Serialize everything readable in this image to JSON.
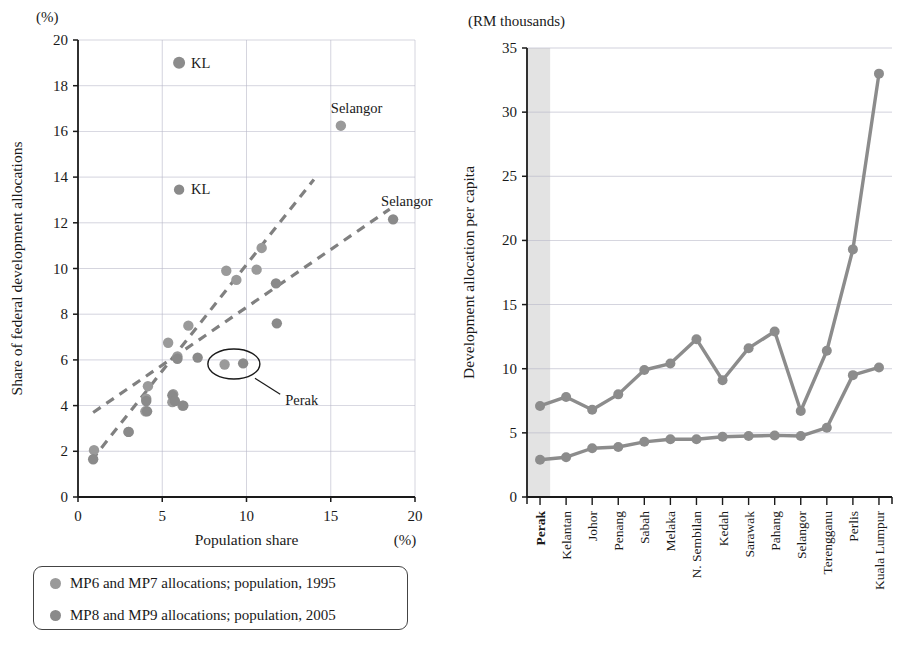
{
  "figure": {
    "panels": [
      "scatter-population-vs-allocation",
      "line-allocation-per-capita"
    ]
  },
  "left": {
    "unit_note": "(%)",
    "y_axis_title": "Share of federal development allocations",
    "x_axis_title": "Population share",
    "x_unit_note": "(%)",
    "y_ticks": [
      "0",
      "2",
      "4",
      "6",
      "8",
      "10",
      "12",
      "14",
      "16",
      "18",
      "20"
    ],
    "x_ticks": [
      "0",
      "5",
      "10",
      "15",
      "20"
    ],
    "annotations": [
      {
        "text": "KL",
        "x": 6.0,
        "y": 19.0
      },
      {
        "text": "Selangor",
        "x": 15.6,
        "y": 16.25
      },
      {
        "text": "KL",
        "x": 6.0,
        "y": 13.45
      },
      {
        "text": "Selangor",
        "x": 18.7,
        "y": 12.15
      },
      {
        "text": "Perak",
        "x": 9.8,
        "y": 5.85
      }
    ],
    "callout_label": "Perak",
    "colors": {
      "marker": "#8c8c8c",
      "trend": "#808080",
      "axis": "#1a1a1a",
      "grid": "#b9b9c9"
    }
  },
  "right": {
    "unit_note": "(RM thousands)",
    "y_axis_title": "Development allocation per capita",
    "y_ticks": [
      "0",
      "5",
      "10",
      "15",
      "20",
      "25",
      "30",
      "35"
    ],
    "highlight_category": "Perak",
    "colors": {
      "line": "#8c8c8c",
      "marker": "#8c8c8c",
      "band": "#e3e3e3",
      "grid": "#b9b9c9"
    }
  },
  "legend": {
    "items": [
      {
        "label": "MP6 and MP7 allocations; population, 1995",
        "color": "#9a9a9a"
      },
      {
        "label": "MP8 and MP9 allocations; population, 2005",
        "color": "#8a8a8a"
      }
    ]
  },
  "chart_data": [
    {
      "type": "scatter",
      "id": "scatter-population-vs-allocation",
      "title": "",
      "xlabel": "Population share",
      "ylabel": "Share of federal development allocations",
      "xunit": "(%)",
      "yunit": "(%)",
      "xlim": [
        0,
        20
      ],
      "ylim": [
        0,
        20
      ],
      "xticks": [
        0,
        5,
        10,
        15,
        20
      ],
      "yticks": [
        0,
        2,
        4,
        6,
        8,
        10,
        12,
        14,
        16,
        18,
        20
      ],
      "grid": true,
      "legend_position": "below-plot",
      "series": [
        {
          "name": "MP6 and MP7 allocations; population, 1995",
          "color": "#9a9a9a",
          "points": [
            {
              "x": 0.95,
              "y": 2.05,
              "label": ""
            },
            {
              "x": 3.0,
              "y": 2.85,
              "label": ""
            },
            {
              "x": 4.0,
              "y": 3.75,
              "label": ""
            },
            {
              "x": 4.05,
              "y": 4.3,
              "label": ""
            },
            {
              "x": 4.15,
              "y": 4.85,
              "label": ""
            },
            {
              "x": 5.6,
              "y": 4.15,
              "label": ""
            },
            {
              "x": 5.65,
              "y": 4.5,
              "label": ""
            },
            {
              "x": 6.2,
              "y": 4.0,
              "label": ""
            },
            {
              "x": 5.35,
              "y": 6.75,
              "label": ""
            },
            {
              "x": 5.9,
              "y": 6.15,
              "label": ""
            },
            {
              "x": 8.7,
              "y": 5.8,
              "label": "Perak"
            },
            {
              "x": 6.55,
              "y": 7.5,
              "label": ""
            },
            {
              "x": 8.8,
              "y": 9.9,
              "label": ""
            },
            {
              "x": 9.4,
              "y": 9.5,
              "label": ""
            },
            {
              "x": 10.6,
              "y": 9.95,
              "label": ""
            },
            {
              "x": 10.9,
              "y": 10.9,
              "label": ""
            },
            {
              "x": 6.0,
              "y": 19.0,
              "label": "KL"
            },
            {
              "x": 15.6,
              "y": 16.25,
              "label": "Selangor"
            }
          ]
        },
        {
          "name": "MP8 and MP9 allocations; population, 2005",
          "color": "#8a8a8a",
          "points": [
            {
              "x": 0.9,
              "y": 1.65,
              "label": ""
            },
            {
              "x": 3.0,
              "y": 2.85,
              "label": ""
            },
            {
              "x": 4.05,
              "y": 4.2,
              "label": ""
            },
            {
              "x": 4.1,
              "y": 3.75,
              "label": ""
            },
            {
              "x": 5.6,
              "y": 4.45,
              "label": ""
            },
            {
              "x": 5.75,
              "y": 4.2,
              "label": ""
            },
            {
              "x": 6.25,
              "y": 4.0,
              "label": ""
            },
            {
              "x": 5.9,
              "y": 6.05,
              "label": ""
            },
            {
              "x": 7.1,
              "y": 6.1,
              "label": ""
            },
            {
              "x": 9.8,
              "y": 5.85,
              "label": "Perak"
            },
            {
              "x": 11.8,
              "y": 7.6,
              "label": ""
            },
            {
              "x": 11.75,
              "y": 9.35,
              "label": ""
            },
            {
              "x": 6.0,
              "y": 13.45,
              "label": "KL"
            },
            {
              "x": 18.7,
              "y": 12.15,
              "label": "Selangor"
            }
          ]
        }
      ],
      "trendlines": [
        {
          "name": "steep-dashed-1995",
          "x0": 0.8,
          "y0": 1.6,
          "x1": 14.0,
          "y1": 13.9
        },
        {
          "name": "shallow-dashed-2005",
          "x0": 0.9,
          "y0": 3.7,
          "x1": 18.5,
          "y1": 12.6
        }
      ],
      "callouts": [
        {
          "text": "Perak",
          "encircles": [
            {
              "x": 8.7,
              "y": 5.8
            },
            {
              "x": 9.8,
              "y": 5.85
            }
          ]
        }
      ]
    },
    {
      "type": "line",
      "id": "line-allocation-per-capita",
      "title": "",
      "xlabel": "",
      "ylabel": "Development allocation per capita",
      "yunit": "(RM thousands)",
      "ylim": [
        0,
        35
      ],
      "yticks": [
        0,
        5,
        10,
        15,
        20,
        25,
        30,
        35
      ],
      "grid": true,
      "highlight_band": "Perak",
      "categories": [
        "Perak",
        "Kelantan",
        "Johor",
        "Penang",
        "Sabah",
        "Melaka",
        "N. Sembilan",
        "Kedah",
        "Sarawak",
        "Pahang",
        "Selangor",
        "Terengganu",
        "Perlis",
        "Kuala Lumpur"
      ],
      "series": [
        {
          "name": "MP6 and MP7 allocations; population, 1995",
          "color": "#8c8c8c",
          "values": [
            7.1,
            7.8,
            6.8,
            8.0,
            9.9,
            10.4,
            12.3,
            9.1,
            11.6,
            12.9,
            6.7,
            11.4,
            19.3,
            33.0
          ]
        },
        {
          "name": "MP8 and MP9 allocations; population, 2005",
          "color": "#8c8c8c",
          "values": [
            2.9,
            3.1,
            3.8,
            3.9,
            4.3,
            4.5,
            4.5,
            4.7,
            4.75,
            4.8,
            4.75,
            5.4,
            9.5,
            10.1
          ]
        }
      ]
    }
  ]
}
